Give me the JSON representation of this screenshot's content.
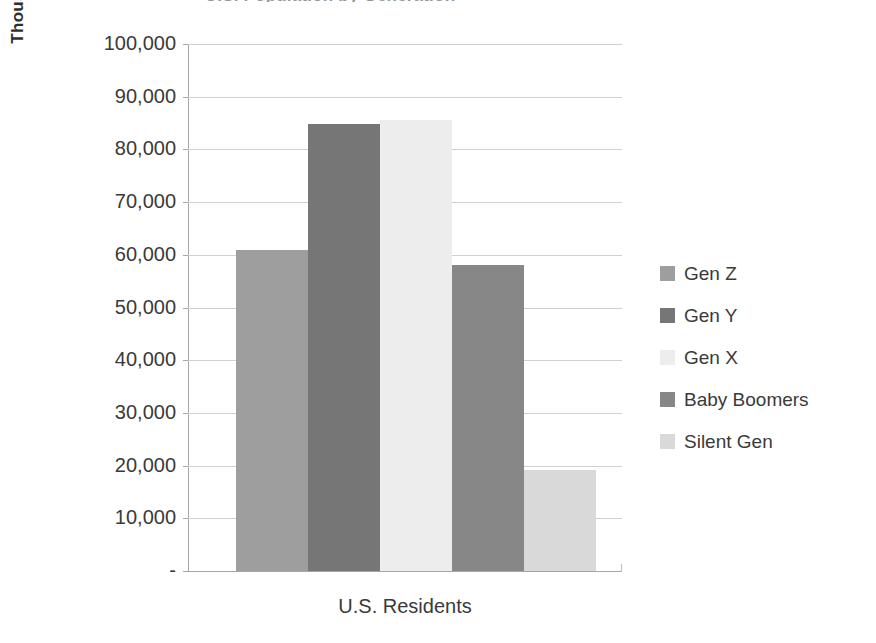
{
  "chart_data": {
    "type": "bar",
    "title": "U.S. Population by Generation",
    "xlabel": "U.S. Residents",
    "ylabel": "Thousands",
    "categories": [
      "Gen Z",
      "Gen Y",
      "Gen X",
      "Baby Boomers",
      "Silent Gen"
    ],
    "values": [
      61000,
      84800,
      85600,
      58000,
      19200
    ],
    "series": [
      {
        "name": "U.S. Residents",
        "values": [
          61000,
          84800,
          85600,
          58000,
          19200
        ]
      }
    ],
    "ylim": [
      0,
      100000
    ],
    "ytick_values": [
      0,
      10000,
      20000,
      30000,
      40000,
      50000,
      60000,
      70000,
      80000,
      90000,
      100000
    ],
    "ytick_labels": [
      "-",
      "10,000",
      "20,000",
      "30,000",
      "40,000",
      "50,000",
      "60,000",
      "70,000",
      "80,000",
      "90,000",
      "100,000"
    ],
    "grid": true,
    "legend_position": "right",
    "bar_colors": [
      "#9e9e9e",
      "#767676",
      "#ededed",
      "#878787",
      "#d9d9d9"
    ]
  },
  "axis": {
    "y_title": "Thousands",
    "x_title": "U.S. Residents",
    "ticks": [
      {
        "label": "100,000",
        "value": 100000
      },
      {
        "label": "90,000",
        "value": 90000
      },
      {
        "label": "80,000",
        "value": 80000
      },
      {
        "label": "70,000",
        "value": 70000
      },
      {
        "label": "60,000",
        "value": 60000
      },
      {
        "label": "50,000",
        "value": 50000
      },
      {
        "label": "40,000",
        "value": 40000
      },
      {
        "label": "30,000",
        "value": 30000
      },
      {
        "label": "20,000",
        "value": 20000
      },
      {
        "label": "10,000",
        "value": 10000
      },
      {
        "label": "-",
        "value": 0
      }
    ]
  },
  "legend": {
    "items": [
      {
        "label": "Gen Z",
        "color": "#9e9e9e"
      },
      {
        "label": "Gen Y",
        "color": "#767676"
      },
      {
        "label": "Gen X",
        "color": "#ededed"
      },
      {
        "label": "Baby Boomers",
        "color": "#878787"
      },
      {
        "label": "Silent Gen",
        "color": "#d9d9d9"
      }
    ]
  },
  "title": {
    "text": "U.S. Population by Generation"
  }
}
